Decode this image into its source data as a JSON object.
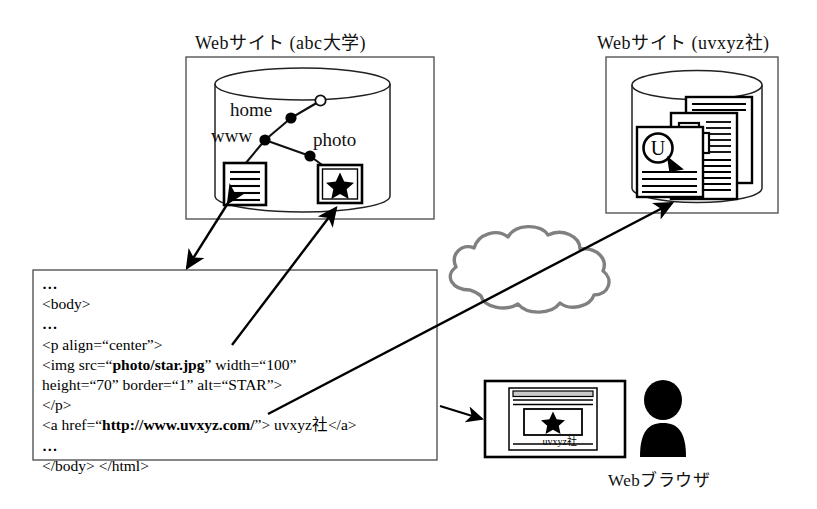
{
  "diagram": {
    "titles": {
      "left_site": "Webサイト (abc大学)",
      "right_site": "Webサイト (uvxyz社)"
    },
    "left_site": {
      "tree_labels": {
        "home": "home",
        "www": "www",
        "photo": "photo"
      },
      "icons": {
        "document": "text-document-icon",
        "image": "star-image-icon"
      },
      "container": "database-cylinder-icon"
    },
    "right_site": {
      "container": "database-cylinder-icon",
      "pages": "stacked-documents-icon",
      "logo_letter": "U"
    },
    "cloud": {
      "name": "internet-cloud-icon",
      "color": "#808080"
    },
    "browser": {
      "window": "browser-window-icon",
      "image": "star-image-icon",
      "caption": "uvxyz社",
      "user": "person-silhouette-icon",
      "label": "Webブラウザ"
    },
    "code": {
      "lines": [
        {
          "id": "l1",
          "parts": [
            {
              "t": "…",
              "b": false,
              "dots": true
            }
          ]
        },
        {
          "id": "l2",
          "parts": [
            {
              "t": "<body>",
              "b": false
            }
          ]
        },
        {
          "id": "l3",
          "parts": [
            {
              "t": "…",
              "b": false,
              "dots": true
            }
          ]
        },
        {
          "id": "l4",
          "parts": [
            {
              "t": "<p align=“center”>",
              "b": false
            }
          ]
        },
        {
          "id": "l5",
          "parts": [
            {
              "t": "<img src=“",
              "b": false
            },
            {
              "t": "photo/star.jpg",
              "b": true
            },
            {
              "t": "” width=“100”",
              "b": false
            }
          ]
        },
        {
          "id": "l6",
          "parts": [
            {
              "t": "height=“70” border=“1” alt=“STAR”>",
              "b": false
            }
          ]
        },
        {
          "id": "l7",
          "parts": [
            {
              "t": "</p>",
              "b": false
            }
          ]
        },
        {
          "id": "l8",
          "parts": [
            {
              "t": "<a href=“",
              "b": false
            },
            {
              "t": "http://www.uvxyz.com/",
              "b": true
            },
            {
              "t": "”> uvxyz社</a>",
              "b": false
            }
          ]
        },
        {
          "id": "l9",
          "parts": [
            {
              "t": "…",
              "b": false,
              "dots": true
            }
          ]
        },
        {
          "id": "l10",
          "parts": [
            {
              "t": "</body> </html>",
              "b": false
            }
          ]
        }
      ]
    },
    "connectors": [
      {
        "name": "arrow-doc-to-code",
        "kind": "double-arrow"
      },
      {
        "name": "arrow-code-to-star",
        "kind": "arrow"
      },
      {
        "name": "arrow-code-to-remote-site",
        "kind": "arrow"
      },
      {
        "name": "arrow-code-to-browser",
        "kind": "arrow"
      }
    ]
  }
}
